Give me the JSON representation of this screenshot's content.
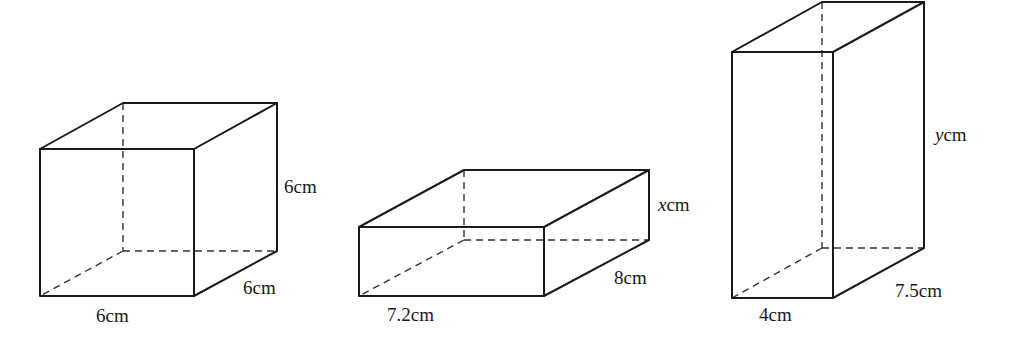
{
  "figures": [
    {
      "name": "cube",
      "labels": {
        "height": "6cm",
        "depth": "6cm",
        "width": "6cm"
      }
    },
    {
      "name": "box-x",
      "labels": {
        "height_var": "x",
        "height_unit": "cm",
        "depth": "8cm",
        "width": "7.2cm"
      }
    },
    {
      "name": "box-y",
      "labels": {
        "height_var": "y",
        "height_unit": "cm",
        "depth": "7.5cm",
        "width": "4cm"
      }
    }
  ]
}
